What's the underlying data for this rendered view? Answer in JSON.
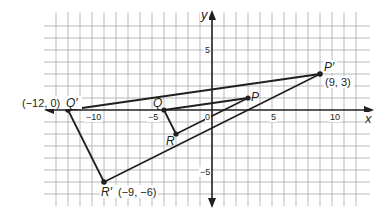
{
  "diagram": {
    "type": "coordinate-plane-dilation",
    "origin_px": [
      212,
      110
    ],
    "unit_px": 12,
    "grid": {
      "x_min": -13,
      "x_max": 12,
      "y_min": -7,
      "y_max": 7
    },
    "axes": {
      "x_label": "x",
      "y_label": "y"
    },
    "ticks": {
      "x": [
        {
          "value": -10,
          "label": "−10"
        },
        {
          "value": -5,
          "label": "−5"
        },
        {
          "value": 0,
          "label": "0"
        },
        {
          "value": 5,
          "label": "5"
        },
        {
          "value": 10,
          "label": "10"
        }
      ],
      "y": [
        {
          "value": 5,
          "label": "5"
        },
        {
          "value": -5,
          "label": "−5"
        }
      ]
    },
    "original_triangle": {
      "points": [
        {
          "name": "P",
          "x": 3,
          "y": 1
        },
        {
          "name": "Q",
          "x": -4,
          "y": 0
        },
        {
          "name": "R",
          "x": -3,
          "y": -2
        }
      ]
    },
    "image_triangle": {
      "points": [
        {
          "name": "P′",
          "x": 9,
          "y": 3,
          "coord_label": "(9, 3)"
        },
        {
          "name": "Q′",
          "x": -12,
          "y": 0,
          "coord_label": "(−12, 0)"
        },
        {
          "name": "R′",
          "x": -9,
          "y": -6,
          "coord_label": "(−9, −6)"
        }
      ]
    },
    "colors": {
      "grid": "#a7a9ac",
      "axis": "#231f20",
      "lines": "#231f20",
      "background": "#ffffff"
    }
  },
  "labels": {
    "x_axis": "x",
    "y_axis": "y",
    "tick_x_neg10": "−10",
    "tick_x_neg5": "−5",
    "tick_x_0": "0",
    "tick_x_5": "5",
    "tick_x_10": "10",
    "tick_y_5": "5",
    "tick_y_neg5": "−5",
    "P": "P",
    "Q": "Q",
    "R": "R",
    "P_prime": "P′",
    "Q_prime": "Q′",
    "R_prime": "R′",
    "P_prime_coord": "(9, 3)",
    "Q_prime_coord": "(−12, 0)",
    "R_prime_coord": "(−9, −6)"
  }
}
